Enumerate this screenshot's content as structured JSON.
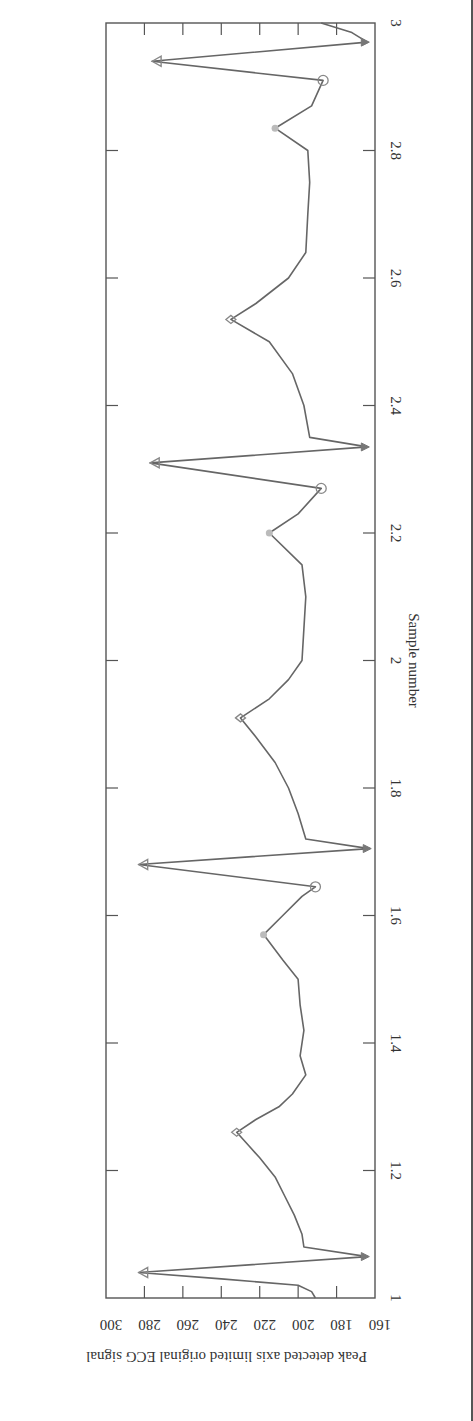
{
  "chart_data": {
    "type": "line",
    "orientation": "rotated-90-clockwise",
    "title": "",
    "xlabel": "Sample number",
    "ylabel": "Peak detected axis limited original ECG signal",
    "xlim": [
      1,
      3
    ],
    "ylim": [
      160,
      300
    ],
    "x_ticks": [
      1,
      1.2,
      1.4,
      1.6,
      1.8,
      2,
      2.2,
      2.4,
      2.6,
      2.8,
      3
    ],
    "x_tick_labels": [
      "1",
      "1.2",
      "1.4",
      "1.6",
      "1.8",
      "2",
      "2.2",
      "2.4",
      "2.6",
      "2.8",
      "3"
    ],
    "y_ticks": [
      160,
      180,
      200,
      220,
      240,
      260,
      280,
      300
    ],
    "y_tick_labels": [
      "160",
      "180",
      "200",
      "220",
      "240",
      "260",
      "280",
      "300"
    ],
    "grid": false,
    "legend": null,
    "series": [
      {
        "name": "ECG signal",
        "color": "#666666",
        "x": [
          1.0,
          1.01,
          1.02,
          1.03,
          1.04,
          1.065,
          1.08,
          1.1,
          1.13,
          1.16,
          1.19,
          1.22,
          1.24,
          1.26,
          1.28,
          1.3,
          1.32,
          1.35,
          1.38,
          1.42,
          1.46,
          1.5,
          1.53,
          1.57,
          1.6,
          1.63,
          1.645,
          1.68,
          1.705,
          1.72,
          1.76,
          1.8,
          1.84,
          1.88,
          1.91,
          1.94,
          1.97,
          2.0,
          2.05,
          2.1,
          2.15,
          2.2,
          2.23,
          2.27,
          2.31,
          2.335,
          2.35,
          2.4,
          2.45,
          2.5,
          2.535,
          2.56,
          2.6,
          2.64,
          2.7,
          2.75,
          2.8,
          2.835,
          2.87,
          2.91,
          2.94,
          2.97,
          2.985,
          3.0
        ],
        "values": [
          191,
          193,
          200,
          240,
          283,
          164,
          197,
          198,
          202,
          207,
          212,
          220,
          226,
          232,
          222,
          210,
          203,
          196,
          199,
          197,
          199,
          200,
          208,
          218,
          208,
          198,
          191,
          283,
          163,
          196,
          200,
          205,
          212,
          222,
          230,
          215,
          205,
          198,
          197,
          196,
          198,
          215,
          200,
          188,
          277,
          164,
          194,
          197,
          203,
          215,
          235,
          222,
          205,
          196,
          195,
          194,
          195,
          212,
          193,
          187,
          276,
          164,
          172,
          188
        ]
      }
    ],
    "markers": {
      "triangle_peak": [
        [
          1.04,
          283
        ],
        [
          1.68,
          283
        ],
        [
          2.31,
          277
        ],
        [
          2.94,
          276
        ]
      ],
      "triangle_trough": [
        [
          1.065,
          164
        ],
        [
          1.705,
          163
        ],
        [
          2.335,
          164
        ],
        [
          2.97,
          164
        ]
      ],
      "diamond_peak": [
        [
          1.26,
          232
        ],
        [
          1.91,
          230
        ],
        [
          2.535,
          235
        ]
      ],
      "star_onset": [
        [
          1.57,
          218
        ],
        [
          2.2,
          215
        ],
        [
          2.835,
          212
        ]
      ],
      "circle_dip": [
        [
          1.645,
          191
        ],
        [
          2.27,
          188
        ],
        [
          2.91,
          187
        ]
      ]
    }
  }
}
